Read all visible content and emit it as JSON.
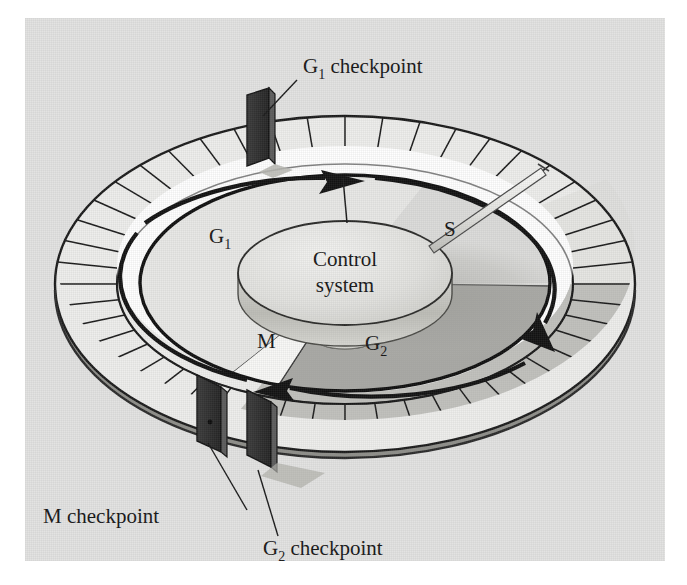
{
  "figure": {
    "kind": "cell-cycle-control-system",
    "panel_background": "#e3e3e2",
    "ink_color": "#151515"
  },
  "center": {
    "line1": "Control",
    "line2": "system",
    "disk_top_fill": "#e0e0de",
    "disk_side_fill": "#c9c9c4"
  },
  "phases": [
    {
      "key": "g1",
      "label": "G",
      "subscript": "1",
      "fill": "#e8e8e6"
    },
    {
      "key": "s",
      "label": "S",
      "subscript": "",
      "fill": "#dcdcda"
    },
    {
      "key": "g2",
      "label": "G",
      "subscript": "2",
      "fill": "#a9a9a5"
    },
    {
      "key": "m",
      "label": "M",
      "subscript": "",
      "fill": "#f7f7f5"
    }
  ],
  "checkpoints": [
    {
      "key": "g1",
      "label": "G",
      "subscript": "1",
      "suffix": " checkpoint",
      "gate_fill": "#2f2f2f"
    },
    {
      "key": "m",
      "label": "M",
      "subscript": "",
      "suffix": " checkpoint",
      "gate_fill": "#2f2f2f"
    },
    {
      "key": "g2",
      "label": "G",
      "subscript": "2",
      "suffix": " checkpoint",
      "gate_fill": "#2f2f2f"
    }
  ],
  "ring": {
    "tick_count": 48,
    "face_fill": "#eeeeec",
    "shadow_fill": "#b9b9b5",
    "outline": "#1a1a1a"
  },
  "track": {
    "band_fill": "#ffffff",
    "arrow_color": "#121212",
    "direction": "clockwise",
    "arrow_count": 3
  },
  "pointer": {
    "name": "indicator-arm",
    "fill": "#f2f2f0",
    "stroke": "#4a4a4a"
  }
}
